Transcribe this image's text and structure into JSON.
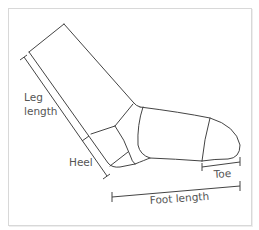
{
  "diagram": {
    "labels": {
      "leg_length_line1": "Leg",
      "leg_length_line2": "length",
      "heel": "Heel",
      "toe": "Toe",
      "foot_length": "Foot length"
    },
    "colors": {
      "line": "#444444",
      "text": "#555555",
      "frame": "#d8d8d8",
      "background": "#ffffff"
    }
  }
}
